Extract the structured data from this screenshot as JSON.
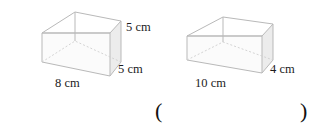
{
  "page": {
    "background_color": "#ffffff",
    "ink_color": "#1c1c1c",
    "line_color": "#b9b9b9",
    "shade_color": "#e9e9e9"
  },
  "figures": [
    {
      "id": "left-box",
      "name": "open-rectangular-box-left",
      "shape": "rectangular prism",
      "labels": {
        "height": "5 cm",
        "depth": "5 cm",
        "width": "8 cm"
      }
    },
    {
      "id": "right-box",
      "name": "open-rectangular-box-right",
      "shape": "rectangular prism",
      "labels": {
        "depth": "4 cm",
        "width": "10 cm"
      }
    }
  ],
  "answer": {
    "open_paren": "(",
    "close_paren": ")"
  }
}
